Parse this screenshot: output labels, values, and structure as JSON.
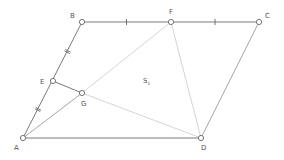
{
  "diagram": {
    "points": [
      {
        "id": "A",
        "label": "A"
      },
      {
        "id": "B",
        "label": "B"
      },
      {
        "id": "C",
        "label": "C"
      },
      {
        "id": "D",
        "label": "D"
      },
      {
        "id": "E",
        "label": "E"
      },
      {
        "id": "F",
        "label": "F"
      },
      {
        "id": "G",
        "label": "G"
      }
    ],
    "segments": [
      {
        "from": "A",
        "to": "B",
        "style": "dark"
      },
      {
        "from": "B",
        "to": "C",
        "style": "dark"
      },
      {
        "from": "C",
        "to": "D",
        "style": "mid"
      },
      {
        "from": "A",
        "to": "D",
        "style": "dark"
      },
      {
        "from": "E",
        "to": "G",
        "style": "dark"
      },
      {
        "from": "A",
        "to": "G",
        "style": "mid"
      },
      {
        "from": "F",
        "to": "G",
        "style": "light"
      },
      {
        "from": "G",
        "to": "D",
        "style": "light"
      },
      {
        "from": "F",
        "to": "D",
        "style": "light"
      }
    ],
    "equal_marks": [
      {
        "segment": "BF",
        "marks": 1
      },
      {
        "segment": "FC",
        "marks": 1
      },
      {
        "segment": "BE",
        "marks": 2
      },
      {
        "segment": "EA",
        "marks": 2
      }
    ],
    "region_label": {
      "main": "S",
      "subscript": "1"
    }
  }
}
